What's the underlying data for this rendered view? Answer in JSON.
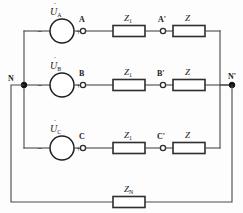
{
  "diagram": {
    "colors": {
      "wire": "#4a4a4a",
      "component_outline": "#2e2e2e",
      "node_fill": "#111111",
      "background": "#fdfdfd"
    }
  },
  "sources": [
    {
      "id": "source-a",
      "symbol": "U",
      "subscript": "A",
      "dot_accent": "˙",
      "minus": "−",
      "plus": "+"
    },
    {
      "id": "source-b",
      "symbol": "U",
      "subscript": "B",
      "dot_accent": "˙",
      "minus": "−",
      "plus": "+"
    },
    {
      "id": "source-c",
      "symbol": "U",
      "subscript": "C",
      "dot_accent": "˙",
      "minus": "−",
      "plus": "+"
    }
  ],
  "line_impedances": [
    {
      "id": "z1-phase-a",
      "symbol": "Z",
      "subscript": "1"
    },
    {
      "id": "z1-phase-b",
      "symbol": "Z",
      "subscript": "1"
    },
    {
      "id": "z1-phase-c",
      "symbol": "Z",
      "subscript": "1"
    }
  ],
  "load_impedances": [
    {
      "id": "z-load-a",
      "symbol": "Z",
      "subscript": ""
    },
    {
      "id": "z-load-b",
      "symbol": "Z",
      "subscript": ""
    },
    {
      "id": "z-load-c",
      "symbol": "Z",
      "subscript": ""
    }
  ],
  "neutral_impedance": {
    "id": "zn",
    "symbol": "Z",
    "subscript": "N"
  },
  "terminals": [
    {
      "id": "terminal-a",
      "label": "A"
    },
    {
      "id": "terminal-a-prime",
      "label": "A'"
    },
    {
      "id": "terminal-b",
      "label": "B"
    },
    {
      "id": "terminal-b-prime",
      "label": "B'"
    },
    {
      "id": "terminal-c",
      "label": "C"
    },
    {
      "id": "terminal-c-prime",
      "label": "C'"
    }
  ],
  "neutral_nodes": [
    {
      "id": "node-n",
      "label": "N"
    },
    {
      "id": "node-n-prime",
      "label": "N'"
    }
  ]
}
